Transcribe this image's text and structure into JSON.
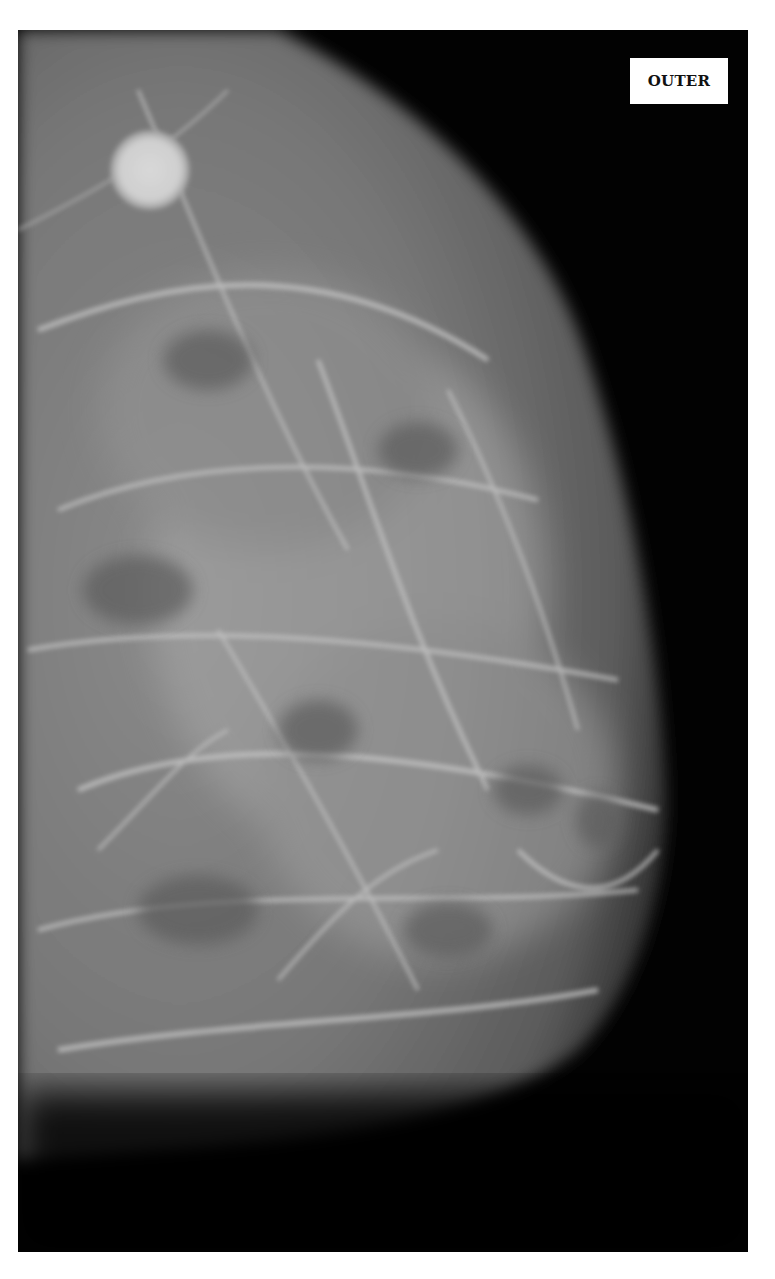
{
  "figure": {
    "type": "mammogram",
    "view_label": "OUTER",
    "colors": {
      "page_background": "#ffffff",
      "film_background": "#020202",
      "tissue_base": "#6e6e6e",
      "tissue_bright": "#bdbdbd",
      "label_background": "#ffffff",
      "label_text": "#111111"
    }
  }
}
